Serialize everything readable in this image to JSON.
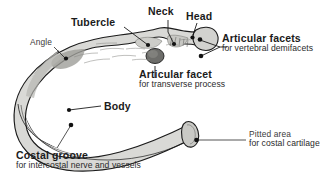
{
  "figure": {
    "background_color": "#ffffff",
    "ink_color": "#1b1b1b",
    "bone_fill_color": "#d9d9d6",
    "bone_shade_color": "#a9a9a6",
    "bone_dark_color": "#5a5a58"
  },
  "labels": {
    "tubercle": {
      "main": "Tubercle",
      "sub": ""
    },
    "neck": {
      "main": "Neck",
      "sub": ""
    },
    "head": {
      "main": "Head",
      "sub": ""
    },
    "angle": {
      "main": "Angle",
      "sub": ""
    },
    "body": {
      "main": "Body",
      "sub": ""
    },
    "articular_facets": {
      "main": "Articular facets",
      "sub": "for vertebral demifacets"
    },
    "articular_facet": {
      "main": "Articular facet",
      "sub": "for transverse process"
    },
    "pitted_area": {
      "main": "Pitted area",
      "sub": "for costal cartilage"
    },
    "costal_groove": {
      "main": "Costal groove",
      "sub": "for intercostal nerve and vessels"
    }
  },
  "leader_dots": [
    {
      "name": "tubercle-dot",
      "x": 148,
      "y": 45
    },
    {
      "name": "neck-dot",
      "x": 174,
      "y": 44
    },
    {
      "name": "head-dot",
      "x": 192,
      "y": 38
    },
    {
      "name": "angle-dot",
      "x": 66,
      "y": 59
    },
    {
      "name": "body-dot",
      "x": 69,
      "y": 110
    },
    {
      "name": "costal-groove-dot",
      "x": 71,
      "y": 125
    },
    {
      "name": "articular-facet-oval",
      "x": 155,
      "y": 57
    },
    {
      "name": "articular-facet-upper",
      "x": 200,
      "y": 40
    },
    {
      "name": "articular-facet-lower",
      "x": 201,
      "y": 56
    },
    {
      "name": "pitted-area-dot",
      "x": 197,
      "y": 140
    }
  ]
}
